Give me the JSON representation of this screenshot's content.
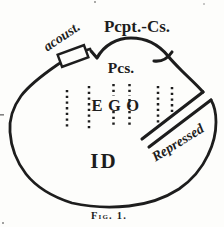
{
  "figure": {
    "caption": "Fig. 1.",
    "labels": {
      "pcpt_cs": "Pcpt.-Cs.",
      "pcs": "Pcs.",
      "acoustic": "acoust.",
      "ego": "EGO",
      "id": "ID",
      "repressed": "Repressed"
    },
    "colors": {
      "ink": "#1d1d1d",
      "paper": "#fdfdfb"
    }
  }
}
